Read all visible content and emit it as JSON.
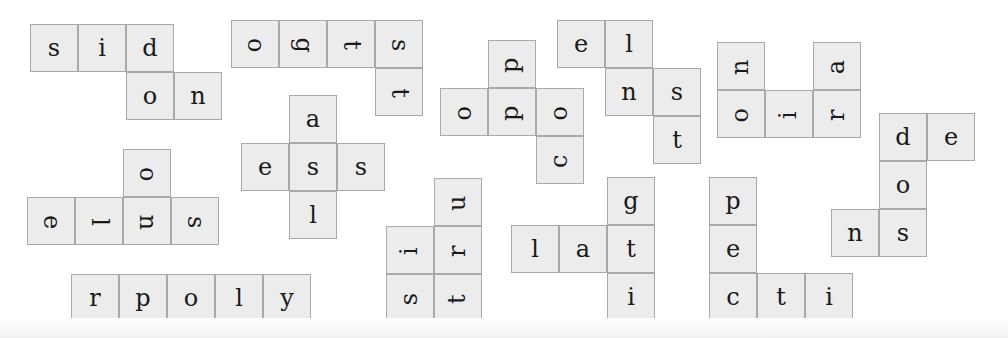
{
  "puzzle": {
    "type": "word-fragment tiles",
    "tile_size": 48,
    "colors": {
      "tile_fill": "#ececec",
      "tile_border": "#a9a9a9",
      "letter": "#1a1a1a"
    },
    "pieces": [
      {
        "id": "piece-1",
        "rotation": 0,
        "tiles": [
          {
            "l": "s",
            "x": 30,
            "y": 24
          },
          {
            "l": "i",
            "x": 78,
            "y": 24
          },
          {
            "l": "d",
            "x": 126,
            "y": 24
          },
          {
            "l": "o",
            "x": 126,
            "y": 72
          },
          {
            "l": "n",
            "x": 174,
            "y": 72
          }
        ]
      },
      {
        "id": "piece-2",
        "rotation": 90,
        "tiles": [
          {
            "l": "o",
            "x": 231,
            "y": 20
          },
          {
            "l": "g",
            "x": 279,
            "y": 20
          },
          {
            "l": "t",
            "x": 327,
            "y": 20
          },
          {
            "l": "s",
            "x": 375,
            "y": 20
          },
          {
            "l": "t",
            "x": 375,
            "y": 68
          }
        ]
      },
      {
        "id": "piece-3",
        "rotation": -90,
        "tiles": [
          {
            "l": "p",
            "x": 488,
            "y": 40
          },
          {
            "l": "o",
            "x": 440,
            "y": 88
          },
          {
            "l": "p",
            "x": 488,
            "y": 88
          },
          {
            "l": "o",
            "x": 536,
            "y": 88
          },
          {
            "l": "c",
            "x": 536,
            "y": 136
          }
        ]
      },
      {
        "id": "piece-4",
        "rotation": 0,
        "tiles": [
          {
            "l": "e",
            "x": 557,
            "y": 20
          },
          {
            "l": "l",
            "x": 605,
            "y": 20
          },
          {
            "l": "n",
            "x": 605,
            "y": 68
          },
          {
            "l": "s",
            "x": 653,
            "y": 68
          },
          {
            "l": "t",
            "x": 653,
            "y": 116
          }
        ]
      },
      {
        "id": "piece-5",
        "rotation": -90,
        "tiles": [
          {
            "l": "n",
            "x": 717,
            "y": 42
          },
          {
            "l": "a",
            "x": 813,
            "y": 42
          },
          {
            "l": "o",
            "x": 717,
            "y": 90
          },
          {
            "l": "i",
            "x": 765,
            "y": 90
          },
          {
            "l": "r",
            "x": 813,
            "y": 90
          }
        ]
      },
      {
        "id": "piece-6",
        "rotation": 0,
        "tiles": [
          {
            "l": "d",
            "x": 879,
            "y": 113
          },
          {
            "l": "e",
            "x": 927,
            "y": 113
          },
          {
            "l": "o",
            "x": 879,
            "y": 161
          },
          {
            "l": "n",
            "x": 831,
            "y": 209
          },
          {
            "l": "s",
            "x": 879,
            "y": 209
          }
        ]
      },
      {
        "id": "piece-7",
        "rotation": 90,
        "tiles": [
          {
            "l": "o",
            "x": 123,
            "y": 149
          },
          {
            "l": "e",
            "x": 27,
            "y": 197
          },
          {
            "l": "l",
            "x": 75,
            "y": 197
          },
          {
            "l": "n",
            "x": 123,
            "y": 197
          },
          {
            "l": "s",
            "x": 171,
            "y": 197
          }
        ]
      },
      {
        "id": "piece-8",
        "rotation": 0,
        "tiles": [
          {
            "l": "a",
            "x": 289,
            "y": 95
          },
          {
            "l": "e",
            "x": 241,
            "y": 143
          },
          {
            "l": "s",
            "x": 289,
            "y": 143
          },
          {
            "l": "s",
            "x": 337,
            "y": 143
          },
          {
            "l": "l",
            "x": 289,
            "y": 191
          }
        ]
      },
      {
        "id": "piece-9",
        "rotation": -90,
        "tiles": [
          {
            "l": "u",
            "x": 434,
            "y": 178
          },
          {
            "l": "i",
            "x": 386,
            "y": 226
          },
          {
            "l": "r",
            "x": 434,
            "y": 226
          },
          {
            "l": "s",
            "x": 386,
            "y": 274
          },
          {
            "l": "t",
            "x": 434,
            "y": 274
          }
        ]
      },
      {
        "id": "piece-10",
        "rotation": 0,
        "tiles": [
          {
            "l": "g",
            "x": 607,
            "y": 177
          },
          {
            "l": "l",
            "x": 511,
            "y": 225
          },
          {
            "l": "a",
            "x": 559,
            "y": 225
          },
          {
            "l": "t",
            "x": 607,
            "y": 225
          },
          {
            "l": "i",
            "x": 607,
            "y": 273
          }
        ]
      },
      {
        "id": "piece-11",
        "rotation": 0,
        "tiles": [
          {
            "l": "p",
            "x": 709,
            "y": 177
          },
          {
            "l": "e",
            "x": 709,
            "y": 225
          },
          {
            "l": "c",
            "x": 709,
            "y": 273
          },
          {
            "l": "t",
            "x": 757,
            "y": 273
          },
          {
            "l": "i",
            "x": 805,
            "y": 273
          }
        ]
      },
      {
        "id": "piece-12",
        "rotation": 0,
        "tiles": [
          {
            "l": "r",
            "x": 71,
            "y": 274
          },
          {
            "l": "p",
            "x": 119,
            "y": 274
          },
          {
            "l": "o",
            "x": 167,
            "y": 274
          },
          {
            "l": "l",
            "x": 215,
            "y": 274
          },
          {
            "l": "y",
            "x": 263,
            "y": 274
          }
        ]
      }
    ]
  }
}
